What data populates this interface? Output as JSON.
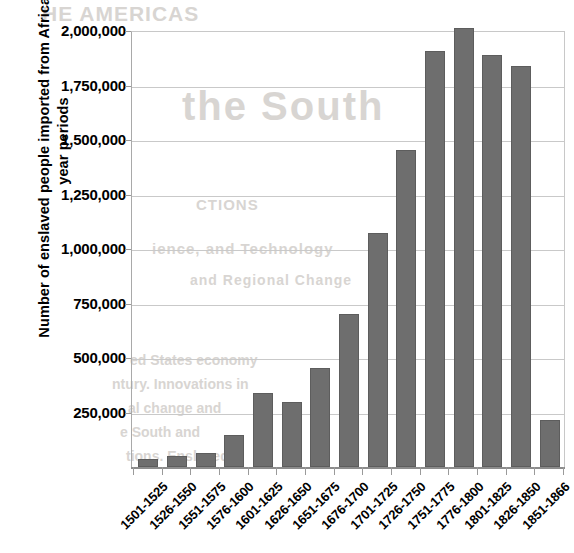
{
  "chart_data": {
    "type": "bar",
    "title": "",
    "xlabel": "",
    "ylabel": "Number of enslaved people imported from Africa per 25-year periods",
    "ylim": [
      0,
      2000000
    ],
    "ytick_values": [
      0,
      250000,
      500000,
      750000,
      1000000,
      1250000,
      1500000,
      1750000,
      2000000
    ],
    "ytick_labels": [
      "0",
      "250,000",
      "500,000",
      "750,000",
      "1,000,000",
      "1,250,000",
      "1,500,000",
      "1,750,000",
      "2,000,000"
    ],
    "ytick_labels_shown": [
      "250,000",
      "500,000",
      "750,000",
      "1,000,000",
      "1,250,000",
      "1,500,000",
      "1,750,000",
      "2,000,000"
    ],
    "grid": true,
    "legend": "none",
    "bar_color": "#6e6e6e",
    "categories": [
      "1501-1525",
      "1526-1550",
      "1551-1575",
      "1576-1600",
      "1601-1625",
      "1626-1650",
      "1651-1675",
      "1676-1700",
      "1701-1725",
      "1726-1750",
      "1751-1775",
      "1776-1800",
      "1801-1825",
      "1826-1850",
      "1851-1866"
    ],
    "values": [
      35000,
      50000,
      65000,
      145000,
      340000,
      300000,
      455000,
      700000,
      1075000,
      1455000,
      1910000,
      2015000,
      1890000,
      1840000,
      215000
    ]
  },
  "background_text": {
    "a": "HE AMERICAS",
    "b": "the South",
    "c": "CTIONS",
    "d": "ience, and Technology",
    "e": "and Regional Change",
    "f": "ed States economy",
    "g": "ntury. Innovations in",
    "h": "al change and",
    "i": "e South and",
    "j": "tions. Enslaved"
  }
}
